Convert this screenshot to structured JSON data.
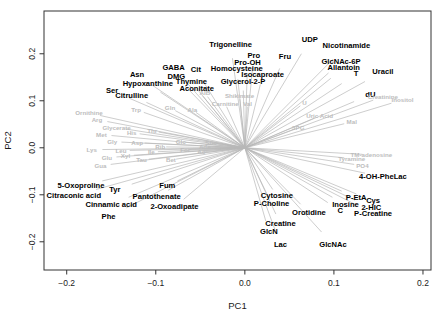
{
  "chart_data": {
    "type": "scatter",
    "variant": "pca-loadings-biplot",
    "title": "",
    "xlabel": "PC1",
    "ylabel": "PC2",
    "xlim": [
      -0.2255,
      0.209
    ],
    "ylim": [
      -0.26,
      0.291
    ],
    "x_ticks": [
      -0.2,
      -0.1,
      0.0,
      0.1,
      0.2
    ],
    "y_ticks": [
      -0.2,
      -0.1,
      0.0,
      0.1,
      0.2
    ],
    "grid": false,
    "legend": "none",
    "arrow_color": "#b8b8b8",
    "highlight_label_color": "#000000",
    "muted_label_color": "#bdbdbd",
    "series": [
      {
        "name": "highlighted-loadings",
        "style": "black-bold",
        "points": [
          {
            "label": "Trigonelline",
            "x": -0.016,
            "y": 0.219
          },
          {
            "label": "UDP",
            "x": 0.073,
            "y": 0.23
          },
          {
            "label": "Nicotinamide",
            "x": 0.114,
            "y": 0.217
          },
          {
            "label": "Pro",
            "x": 0.01,
            "y": 0.196
          },
          {
            "label": "Fru",
            "x": 0.045,
            "y": 0.194
          },
          {
            "label": "Pro-OH",
            "x": 0.003,
            "y": 0.181
          },
          {
            "label": "Homocysteine",
            "x": -0.009,
            "y": 0.168
          },
          {
            "label": "GlcNAc-6P",
            "x": 0.108,
            "y": 0.183
          },
          {
            "label": "Allantoin",
            "x": 0.111,
            "y": 0.17
          },
          {
            "label": "Isocaproate",
            "x": 0.02,
            "y": 0.155
          },
          {
            "label": "T",
            "x": 0.125,
            "y": 0.157
          },
          {
            "label": "Uracil",
            "x": 0.155,
            "y": 0.162
          },
          {
            "label": "Glycerol-2-P",
            "x": -0.002,
            "y": 0.14
          },
          {
            "label": "dU",
            "x": 0.141,
            "y": 0.113
          },
          {
            "label": "GABA",
            "x": -0.08,
            "y": 0.17
          },
          {
            "label": "Cit",
            "x": -0.055,
            "y": 0.166
          },
          {
            "label": "DMG",
            "x": -0.077,
            "y": 0.151
          },
          {
            "label": "Asn",
            "x": -0.121,
            "y": 0.155
          },
          {
            "label": "Thymine",
            "x": -0.06,
            "y": 0.14
          },
          {
            "label": "Hypoxanthine",
            "x": -0.109,
            "y": 0.136
          },
          {
            "label": "Aconitate",
            "x": -0.054,
            "y": 0.126
          },
          {
            "label": "Ser",
            "x": -0.149,
            "y": 0.121
          },
          {
            "label": "Citrulline",
            "x": -0.127,
            "y": 0.111
          },
          {
            "label": "5-Oxoproline",
            "x": -0.184,
            "y": -0.081
          },
          {
            "label": "Tyr",
            "x": -0.146,
            "y": -0.089
          },
          {
            "label": "Citraconic acid",
            "x": -0.192,
            "y": -0.102
          },
          {
            "label": "Fum",
            "x": -0.087,
            "y": -0.081
          },
          {
            "label": "Pantothenate",
            "x": -0.099,
            "y": -0.104
          },
          {
            "label": "Cinnamic acid",
            "x": -0.15,
            "y": -0.121
          },
          {
            "label": "2-Oxoadipate",
            "x": -0.079,
            "y": -0.126
          },
          {
            "label": "Phe",
            "x": -0.153,
            "y": -0.147
          },
          {
            "label": "Cytosine",
            "x": 0.036,
            "y": -0.102
          },
          {
            "label": "P-Choline",
            "x": 0.03,
            "y": -0.119
          },
          {
            "label": "Orotidine",
            "x": 0.072,
            "y": -0.138
          },
          {
            "label": "Creatine",
            "x": 0.04,
            "y": -0.162
          },
          {
            "label": "GlcN",
            "x": 0.027,
            "y": -0.179
          },
          {
            "label": "Lac",
            "x": 0.04,
            "y": -0.206
          },
          {
            "label": "GlcNAc",
            "x": 0.099,
            "y": -0.206
          },
          {
            "label": "Inosine",
            "x": 0.113,
            "y": -0.121
          },
          {
            "label": "C",
            "x": 0.107,
            "y": -0.134
          },
          {
            "label": "P-EtA",
            "x": 0.125,
            "y": -0.106
          },
          {
            "label": "Cys",
            "x": 0.144,
            "y": -0.113
          },
          {
            "label": "2-HIC",
            "x": 0.142,
            "y": -0.128
          },
          {
            "label": "P-Creatine",
            "x": 0.144,
            "y": -0.14
          },
          {
            "label": "4-OH-PheLac",
            "x": 0.155,
            "y": -0.062
          }
        ]
      },
      {
        "name": "muted-loadings",
        "style": "gray-small",
        "points": [
          {
            "label": "AIB",
            "x": -0.045,
            "y": 0.117
          },
          {
            "label": "Shikimate",
            "x": -0.006,
            "y": 0.111
          },
          {
            "label": "Carnitine",
            "x": -0.022,
            "y": 0.094
          },
          {
            "label": "Val",
            "x": 0.003,
            "y": 0.094
          },
          {
            "label": "U",
            "x": 0.067,
            "y": 0.096
          },
          {
            "label": "Creatinine",
            "x": 0.155,
            "y": 0.109
          },
          {
            "label": "Inositol",
            "x": 0.177,
            "y": 0.102
          },
          {
            "label": "Uric Acid",
            "x": 0.084,
            "y": 0.068
          },
          {
            "label": "Mal",
            "x": 0.12,
            "y": 0.055
          },
          {
            "label": "3PG",
            "x": 0.06,
            "y": 0.043
          },
          {
            "label": "TM-adenosine",
            "x": 0.142,
            "y": -0.015
          },
          {
            "label": "Tyramine",
            "x": 0.12,
            "y": -0.023
          },
          {
            "label": "PO4",
            "x": 0.132,
            "y": -0.038
          },
          {
            "label": "Ornithine",
            "x": -0.175,
            "y": 0.074
          },
          {
            "label": "Trp",
            "x": -0.122,
            "y": 0.081
          },
          {
            "label": "Gln",
            "x": -0.084,
            "y": 0.085
          },
          {
            "label": "Ala",
            "x": -0.059,
            "y": 0.081
          },
          {
            "label": "Arg",
            "x": -0.166,
            "y": 0.06
          },
          {
            "label": "Glycerate",
            "x": -0.144,
            "y": 0.043
          },
          {
            "label": "Met",
            "x": -0.161,
            "y": 0.028
          },
          {
            "label": "His",
            "x": -0.127,
            "y": 0.032
          },
          {
            "label": "Thr",
            "x": -0.104,
            "y": 0.036
          },
          {
            "label": "Gly",
            "x": -0.149,
            "y": 0.013
          },
          {
            "label": "Asp",
            "x": -0.121,
            "y": 0.011
          },
          {
            "label": "Glc",
            "x": -0.072,
            "y": 0.013
          },
          {
            "label": "Suc",
            "x": -0.038,
            "y": 0.011
          },
          {
            "label": "Lys",
            "x": -0.172,
            "y": -0.004
          },
          {
            "label": "Leu",
            "x": -0.139,
            "y": -0.006
          },
          {
            "label": "Ile",
            "x": -0.105,
            "y": -0.009
          },
          {
            "label": "Ac",
            "x": -0.049,
            "y": -0.009
          },
          {
            "label": "Glu",
            "x": -0.155,
            "y": -0.021
          },
          {
            "label": "Tau",
            "x": -0.116,
            "y": -0.026
          },
          {
            "label": "Bet",
            "x": -0.083,
            "y": -0.026
          },
          {
            "label": "Gua",
            "x": -0.162,
            "y": -0.038
          },
          {
            "label": "Rib",
            "x": -0.095,
            "y": 0.002
          },
          {
            "label": "For",
            "x": -0.067,
            "y": -0.004
          },
          {
            "label": "Ade",
            "x": -0.045,
            "y": 0.002
          },
          {
            "label": "Xyl",
            "x": -0.134,
            "y": -0.017
          }
        ]
      }
    ]
  }
}
